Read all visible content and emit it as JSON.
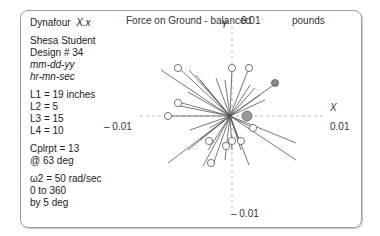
{
  "info": {
    "app_name": "Dynafour",
    "version": "X.x",
    "student": "Shesa Student",
    "design": "Design # 34",
    "date": "mm-dd-yy",
    "time": "hr-mn-sec",
    "L1": "L1 =  19 inches",
    "L2": "L2 =    5",
    "L3": "L3 =  15",
    "L4": "L4 =  10",
    "cplrpt": "Cplrpt = 13",
    "cplrpt_angle": "@  63  deg",
    "omega": "ω2 =  50 rad/sec",
    "range": "0 to 360",
    "step": "by 5 deg"
  },
  "plot": {
    "title": "Force on Ground - balanced",
    "units": "pounds",
    "y_label": "Y",
    "x_label": "X",
    "y_max": "0.01",
    "y_min": "– 0.01",
    "x_max": "0.01",
    "x_min": "– 0.01"
  }
}
